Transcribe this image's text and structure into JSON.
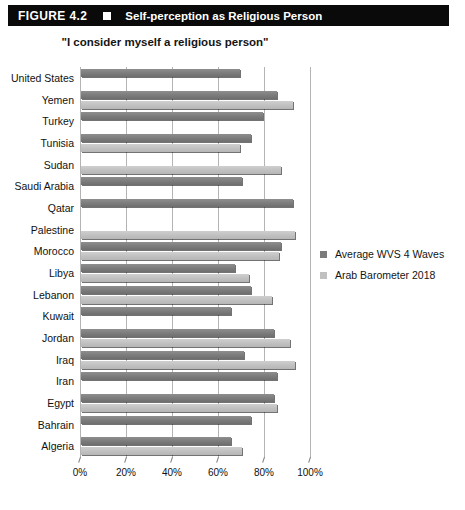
{
  "figure": {
    "number": "FIGURE 4.2",
    "marker": "white-square-icon",
    "title": "Self-perception as Religious Person"
  },
  "chart_subtitle": "\"I consider myself a religious person\"",
  "legend": {
    "position": "right",
    "items": [
      {
        "label": "Average WVS 4 Waves",
        "color": "#7b7b7b"
      },
      {
        "label": "Arab Barometer 2018",
        "color": "#c0c0c0"
      }
    ]
  },
  "axis": {
    "ticks": [
      "0%",
      "20%",
      "40%",
      "60%",
      "80%",
      "100%"
    ],
    "tick_values": [
      0,
      20,
      40,
      60,
      80,
      100
    ]
  },
  "chart_data": {
    "type": "bar",
    "orientation": "horizontal",
    "title": "Self-perception as Religious Person",
    "subtitle": "\"I consider myself a religious person\"",
    "xlabel": "",
    "ylabel": "",
    "xlim": [
      0,
      100
    ],
    "xticks": [
      0,
      20,
      40,
      60,
      80,
      100
    ],
    "xtick_labels": [
      "0%",
      "20%",
      "40%",
      "60%",
      "80%",
      "100%"
    ],
    "grid": true,
    "legend_position": "right",
    "categories": [
      "United States",
      "Yemen",
      "Turkey",
      "Tunisia",
      "Sudan",
      "Saudi Arabia",
      "Qatar",
      "Palestine",
      "Morocco",
      "Libya",
      "Lebanon",
      "Kuwait",
      "Jordan",
      "Iraq",
      "Iran",
      "Egypt",
      "Bahrain",
      "Algeria"
    ],
    "series": [
      {
        "name": "Average WVS 4 Waves",
        "color": "#7b7b7b",
        "values": [
          69,
          85,
          79,
          74,
          null,
          70,
          92,
          null,
          87,
          67,
          74,
          65,
          84,
          71,
          85,
          84,
          74,
          65
        ]
      },
      {
        "name": "Arab Barometer 2018",
        "color": "#c0c0c0",
        "values": [
          null,
          92,
          null,
          69,
          87,
          null,
          null,
          93,
          86,
          73,
          83,
          null,
          91,
          93,
          null,
          85,
          null,
          70
        ]
      }
    ]
  }
}
